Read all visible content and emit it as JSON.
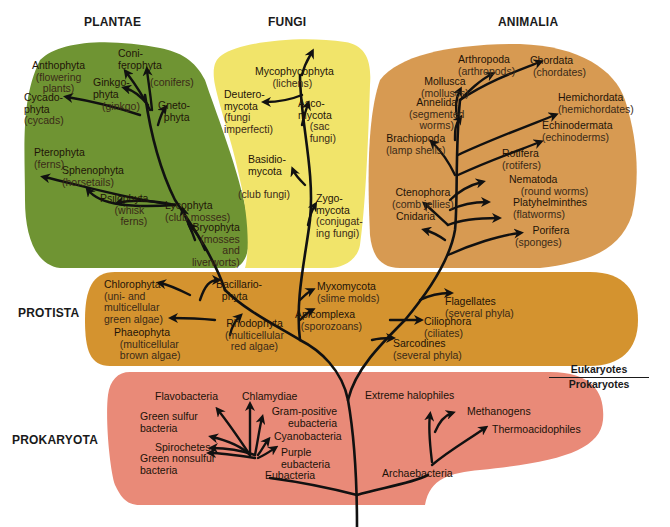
{
  "colors": {
    "plantae": "#6f9433",
    "fungi": "#f1e46a",
    "animalia": "#d79a52",
    "protista": "#d4932f",
    "prokaryota": "#e98a78",
    "branch": "#111111"
  },
  "kingdoms": {
    "plantae": "PLANTAE",
    "fungi": "FUNGI",
    "animalia": "ANIMALIA",
    "protista": "PROTISTA",
    "prokaryota": "PROKARYOTA"
  },
  "divider": {
    "top": "Eukaryotes",
    "bottom": "Prokaryotes"
  },
  "plantae": [
    {
      "name": "Anthophyta",
      "sub": "(flowering plants)"
    },
    {
      "name": "Coni-ferophyta",
      "sub": "(conifers)"
    },
    {
      "name": "Ginkgo-phyta",
      "sub": "(ginkgo)"
    },
    {
      "name": "Cycado-phyta",
      "sub": "(cycads)"
    },
    {
      "name": "Gneto-phyta",
      "sub": ""
    },
    {
      "name": "Pterophyta",
      "sub": "(ferns)"
    },
    {
      "name": "Sphenophyta",
      "sub": "(horsetails)"
    },
    {
      "name": "Psilophyta",
      "sub": "(whisk ferns)"
    },
    {
      "name": "Lycophyta",
      "sub": "(club mosses)"
    },
    {
      "name": "Bryophyta",
      "sub": "(mosses and liverworts)"
    }
  ],
  "fungi": [
    {
      "name": "Mycophycophyta",
      "sub": "(lichens)"
    },
    {
      "name": "Deutero-mycota",
      "sub": "(fungi imperfecti)"
    },
    {
      "name": "Asco-mycota",
      "sub": "(sac fungi)"
    },
    {
      "name": "Basidio-mycota",
      "sub": "(club fungi)"
    },
    {
      "name": "Zygo-mycota",
      "sub": "(conjugating fungi)"
    }
  ],
  "animalia": [
    {
      "name": "Arthropoda",
      "sub": "(arthropods)"
    },
    {
      "name": "Chordata",
      "sub": "(chordates)"
    },
    {
      "name": "Mollusca",
      "sub": "(molluscs)"
    },
    {
      "name": "Annelida",
      "sub": "(segmented worms)"
    },
    {
      "name": "Hemichordata",
      "sub": "(hemichordates)"
    },
    {
      "name": "Echinodermata",
      "sub": "(echinoderms)"
    },
    {
      "name": "Brachiopoda",
      "sub": "(lamp shells)"
    },
    {
      "name": "Rotifera",
      "sub": "(rotifers)"
    },
    {
      "name": "Nematoda",
      "sub": "(round worms)"
    },
    {
      "name": "Ctenophora",
      "sub": "(comb jellies)"
    },
    {
      "name": "Platyhelminthes",
      "sub": "(flatworms)"
    },
    {
      "name": "Cnidaria",
      "sub": ""
    },
    {
      "name": "Porifera",
      "sub": "(sponges)"
    }
  ],
  "protista": [
    {
      "name": "Chlorophyta",
      "sub": "(uni- and multicellular green algae)"
    },
    {
      "name": "Bacillario-phyta",
      "sub": ""
    },
    {
      "name": "Phaeophyta",
      "sub": "(multicellular brown algae)"
    },
    {
      "name": "Rhodophyta",
      "sub": "(multicellular red algae)"
    },
    {
      "name": "Myxomycota",
      "sub": "(slime molds)"
    },
    {
      "name": "Apicomplexa",
      "sub": "(sporozoans)"
    },
    {
      "name": "Flagellates",
      "sub": "(several phyla)"
    },
    {
      "name": "Ciliophora",
      "sub": "(ciliates)"
    },
    {
      "name": "Sarcodines",
      "sub": "(several phyla)"
    }
  ],
  "prokaryota": {
    "eubacteria": [
      "Flavobacteria",
      "Chlamydiae",
      "Green sulfur bacteria",
      "Gram-positive eubacteria",
      "Cyanobacteria",
      "Spirochetes",
      "Green nonsulfur bacteria",
      "Purple eubacteria",
      "Eubacteria"
    ],
    "archaebacteria": [
      "Extreme halophiles",
      "Methanogens",
      "Thermoacidophiles",
      "Archaebacteria"
    ]
  }
}
